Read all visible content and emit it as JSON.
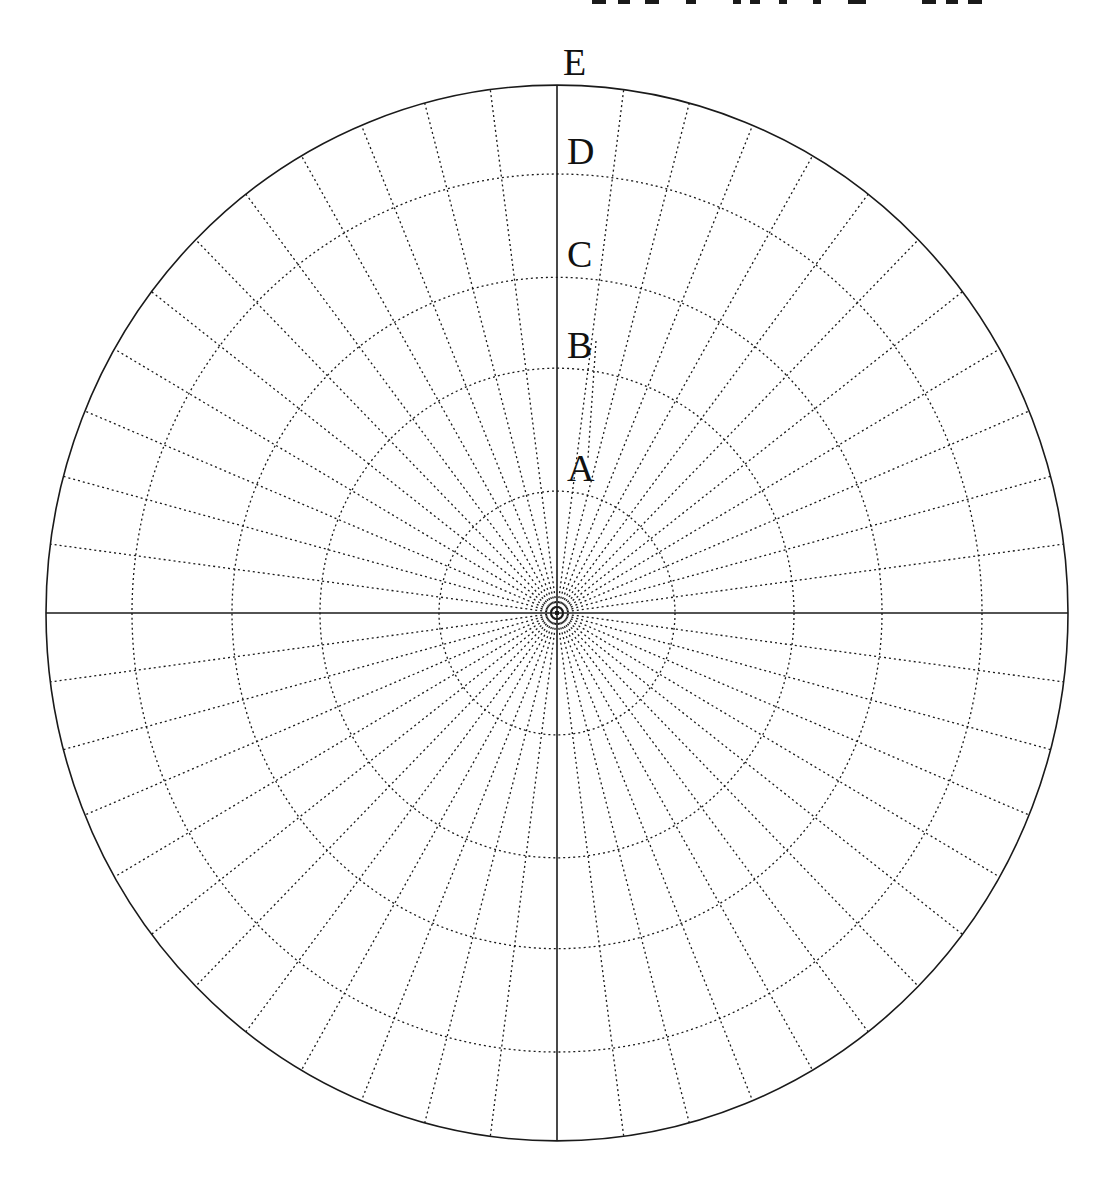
{
  "diagram": {
    "type": "polar-grid",
    "center": {
      "x": 557,
      "y": 613
    },
    "aspect_y": 1.033,
    "outer_radius_x": 511,
    "rings": [
      {
        "label": "A",
        "radius_x": 118
      },
      {
        "label": "B",
        "radius_x": 237
      },
      {
        "label": "C",
        "radius_x": 325
      },
      {
        "label": "D",
        "radius_x": 425
      },
      {
        "label": "E",
        "radius_x": 511
      }
    ],
    "ring_labels": [
      "A",
      "B",
      "C",
      "D",
      "E"
    ],
    "spokes": {
      "count": 48,
      "spacing_deg": 7.5,
      "style": "dotted"
    },
    "axes": {
      "horizontal": "solid",
      "vertical": "solid"
    },
    "colors": {
      "line": "#1a1a1a",
      "background": "#ffffff"
    }
  },
  "top_cropped_text": {
    "visible": true,
    "note": "illegible cropped text fragments at top edge"
  }
}
